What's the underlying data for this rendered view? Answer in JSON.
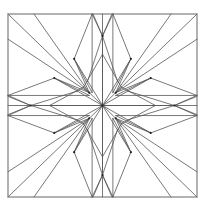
{
  "figure": {
    "background": "#ffffff",
    "line_color": "#555555",
    "frame": {
      "x0": 8,
      "y0": 14,
      "x1": 197,
      "y1": 197
    },
    "center": [
      0.5,
      0.5
    ],
    "grid_lines": [
      0.25,
      0.75
    ],
    "inner_star_tips": [
      [
        0.5,
        0.22
      ],
      [
        0.78,
        0.5
      ],
      [
        0.5,
        0.78
      ],
      [
        0.22,
        0.5
      ]
    ],
    "inner_diag_points": [
      [
        0.4,
        0.4
      ],
      [
        0.6,
        0.4
      ],
      [
        0.6,
        0.6
      ],
      [
        0.4,
        0.6
      ]
    ]
  }
}
